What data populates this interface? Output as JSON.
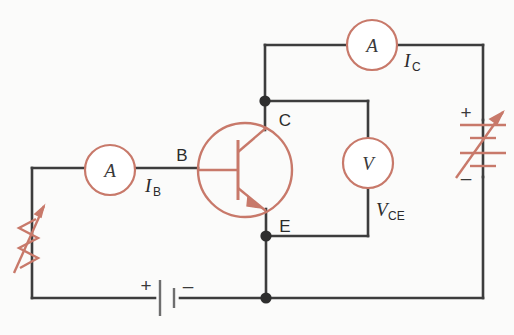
{
  "figure": {
    "type": "schematic-circuit-diagram",
    "width": 514,
    "height": 335,
    "background_color": "#fbfbfa"
  },
  "colors": {
    "wire": "#3d3d3d",
    "component_red": "#c8796a",
    "component_red_light": "#d08a7a",
    "node_dot": "#2e2e2e",
    "text": "#2b2b2b",
    "battery_gray": "#6e6e6e"
  },
  "labels": {
    "base_terminal": "B",
    "collector_terminal": "C",
    "emitter_terminal": "E",
    "base_current": "I",
    "base_current_sub": "B",
    "collector_current": "I",
    "collector_current_sub": "C",
    "ce_voltage": "V",
    "ce_voltage_sub": "CE",
    "base_ammeter": "A",
    "collector_ammeter": "A",
    "voltmeter": "V",
    "supply_plus": "+",
    "supply_minus": "–",
    "base_battery_plus": "+",
    "base_battery_minus": "–"
  },
  "components": [
    {
      "name": "base-ammeter",
      "kind": "ammeter",
      "symbol": "A",
      "measures": "I_B",
      "cx": 110,
      "cy": 170,
      "r": 25
    },
    {
      "name": "collector-ammeter",
      "kind": "ammeter",
      "symbol": "A",
      "measures": "I_C",
      "cx": 372,
      "cy": 45,
      "r": 25
    },
    {
      "name": "voltmeter",
      "kind": "voltmeter",
      "symbol": "V",
      "measures": "V_CE",
      "cx": 368,
      "cy": 163,
      "r": 25
    },
    {
      "name": "npn-transistor",
      "kind": "transistor-npn",
      "cx": 245,
      "cy": 170,
      "r": 47,
      "terminals": [
        "B",
        "C",
        "E"
      ]
    },
    {
      "name": "variable-resistor",
      "kind": "rheostat",
      "x": 32,
      "y": 232,
      "orientation": "vertical"
    },
    {
      "name": "base-battery",
      "kind": "cell",
      "cells": 1,
      "x": 155,
      "y": 298,
      "orientation": "horizontal"
    },
    {
      "name": "collector-supply",
      "kind": "variable-battery",
      "cells": 2,
      "x": 483,
      "y": 148,
      "orientation": "vertical"
    }
  ],
  "nodes": [
    {
      "name": "collector-node",
      "x": 265,
      "y": 101
    },
    {
      "name": "emitter-node",
      "x": 266,
      "y": 236
    },
    {
      "name": "bottom-rail-node",
      "x": 266,
      "y": 298
    }
  ]
}
